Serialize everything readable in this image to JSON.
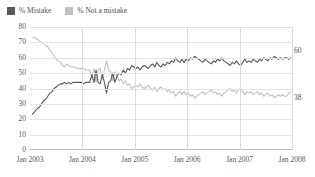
{
  "legend": {
    "items": [
      {
        "label": "% Mistake",
        "color": "#595959",
        "icon": "legend-swatch-mistake"
      },
      {
        "label": "% Not a mistake",
        "color": "#c0c0c0",
        "icon": "legend-swatch-not-mistake"
      }
    ]
  },
  "axes": {
    "y_ticks": [
      "80",
      "70",
      "60",
      "50",
      "40",
      "30",
      "20",
      "10",
      "0"
    ],
    "x_ticks": [
      "Jan 2003",
      "Jan 2004",
      "Jan 2005",
      "Jan 2006",
      "Jan 2007",
      "Jan 2008"
    ]
  },
  "end_labels": {
    "mistake": "60",
    "not_a_mistake": "38"
  },
  "chart_data": {
    "type": "line",
    "title": "",
    "subtitle": "",
    "xlabel": "",
    "ylabel": "",
    "xlim": [
      "Jan 2003",
      "Jan 2008"
    ],
    "ylim": [
      0,
      80
    ],
    "y_ticks": [
      0,
      10,
      20,
      30,
      40,
      50,
      60,
      70,
      80
    ],
    "x_ticks": [
      "Jan 2003",
      "Jan 2004",
      "Jan 2005",
      "Jan 2006",
      "Jan 2007",
      "Jan 2008"
    ],
    "grid": true,
    "legend_position": "top-left",
    "series": [
      {
        "name": "% Mistake",
        "color": "#595959",
        "end_value": 60,
        "x": [
          0.04,
          0.09,
          0.14,
          0.18,
          0.22,
          0.26,
          0.3,
          0.34,
          0.38,
          0.42,
          0.46,
          0.5,
          0.54,
          0.58,
          0.62,
          0.66,
          0.7,
          0.74,
          0.78,
          0.82,
          0.86,
          0.9,
          0.94,
          0.98,
          1.02,
          1.06,
          1.1,
          1.14,
          1.18,
          1.22,
          1.26,
          1.3,
          1.34,
          1.38,
          1.42,
          1.46,
          1.5,
          1.54,
          1.58,
          1.62,
          1.66,
          1.7,
          1.74,
          1.78,
          1.82,
          1.86,
          1.9,
          1.94,
          1.98,
          2.02,
          2.06,
          2.1,
          2.14,
          2.18,
          2.22,
          2.26,
          2.3,
          2.34,
          2.38,
          2.42,
          2.46,
          2.5,
          2.54,
          2.58,
          2.62,
          2.66,
          2.7,
          2.74,
          2.78,
          2.82,
          2.86,
          2.9,
          2.94,
          2.98,
          3.02,
          3.06,
          3.1,
          3.14,
          3.18,
          3.22,
          3.26,
          3.3,
          3.34,
          3.38,
          3.42,
          3.46,
          3.5,
          3.54,
          3.58,
          3.62,
          3.66,
          3.7,
          3.74,
          3.78,
          3.82,
          3.86,
          3.9,
          3.94,
          3.98,
          4.02,
          4.06,
          4.1,
          4.14,
          4.18,
          4.22,
          4.26,
          4.3,
          4.34,
          4.38,
          4.42,
          4.46,
          4.5,
          4.54,
          4.58,
          4.62,
          4.66,
          4.7,
          4.74,
          4.78,
          4.82,
          4.86,
          4.9,
          4.94,
          4.98
        ],
        "values": [
          23,
          25,
          27,
          28,
          30,
          32,
          33,
          35,
          37,
          38,
          40,
          41,
          42,
          43,
          43,
          44,
          43,
          44,
          43,
          44,
          44,
          44,
          44,
          44,
          43,
          44,
          44,
          44,
          49,
          44,
          52,
          44,
          43,
          49,
          44,
          37,
          44,
          45,
          50,
          44,
          48,
          50,
          49,
          52,
          50,
          53,
          52,
          55,
          54,
          53,
          54,
          52,
          54,
          55,
          54,
          53,
          55,
          56,
          54,
          57,
          55,
          54,
          56,
          55,
          57,
          56,
          58,
          57,
          60,
          58,
          57,
          59,
          57,
          59,
          58,
          60,
          59,
          61,
          60,
          59,
          58,
          57,
          59,
          58,
          57,
          56,
          58,
          57,
          59,
          58,
          60,
          58,
          57,
          56,
          55,
          57,
          56,
          58,
          56,
          55,
          57,
          59,
          57,
          58,
          57,
          59,
          58,
          57,
          59,
          58,
          60,
          59,
          58,
          60,
          59,
          61,
          60,
          59,
          60,
          59,
          60,
          60,
          59,
          60
        ]
      },
      {
        "name": "% Not a mistake",
        "color": "#c0c0c0",
        "end_value": 38,
        "x": [
          0.04,
          0.09,
          0.14,
          0.18,
          0.22,
          0.26,
          0.3,
          0.34,
          0.38,
          0.42,
          0.46,
          0.5,
          0.54,
          0.58,
          0.62,
          0.66,
          0.7,
          0.74,
          0.78,
          0.82,
          0.86,
          0.9,
          0.94,
          0.98,
          1.02,
          1.06,
          1.1,
          1.14,
          1.18,
          1.22,
          1.26,
          1.3,
          1.34,
          1.38,
          1.42,
          1.46,
          1.5,
          1.54,
          1.58,
          1.62,
          1.66,
          1.7,
          1.74,
          1.78,
          1.82,
          1.86,
          1.9,
          1.94,
          1.98,
          2.02,
          2.06,
          2.1,
          2.14,
          2.18,
          2.22,
          2.26,
          2.3,
          2.34,
          2.38,
          2.42,
          2.46,
          2.5,
          2.54,
          2.58,
          2.62,
          2.66,
          2.7,
          2.74,
          2.78,
          2.82,
          2.86,
          2.9,
          2.94,
          2.98,
          3.02,
          3.06,
          3.1,
          3.14,
          3.18,
          3.22,
          3.26,
          3.3,
          3.34,
          3.38,
          3.42,
          3.46,
          3.5,
          3.54,
          3.58,
          3.62,
          3.66,
          3.7,
          3.74,
          3.78,
          3.82,
          3.86,
          3.9,
          3.94,
          3.98,
          4.02,
          4.06,
          4.1,
          4.14,
          4.18,
          4.22,
          4.26,
          4.3,
          4.34,
          4.38,
          4.42,
          4.46,
          4.5,
          4.54,
          4.58,
          4.62,
          4.66,
          4.7,
          4.74,
          4.78,
          4.82,
          4.86,
          4.9,
          4.94,
          4.98
        ],
        "values": [
          73,
          73,
          72,
          71,
          70,
          69,
          68,
          67,
          65,
          63,
          61,
          59,
          58,
          57,
          55,
          54,
          56,
          55,
          54,
          54,
          54,
          53,
          53,
          53,
          53,
          52,
          52,
          52,
          47,
          53,
          44,
          52,
          53,
          46,
          52,
          58,
          52,
          51,
          45,
          51,
          48,
          45,
          46,
          43,
          45,
          42,
          43,
          40,
          41,
          42,
          41,
          43,
          41,
          40,
          41,
          42,
          40,
          39,
          41,
          38,
          40,
          41,
          39,
          40,
          38,
          39,
          37,
          38,
          35,
          37,
          38,
          36,
          38,
          36,
          37,
          35,
          36,
          34,
          35,
          36,
          37,
          38,
          36,
          37,
          38,
          39,
          37,
          38,
          36,
          37,
          35,
          37,
          38,
          39,
          40,
          38,
          39,
          37,
          39,
          40,
          38,
          36,
          38,
          37,
          38,
          36,
          37,
          38,
          36,
          37,
          35,
          36,
          37,
          35,
          36,
          34,
          35,
          36,
          35,
          36,
          35,
          35,
          37,
          38
        ]
      }
    ]
  }
}
